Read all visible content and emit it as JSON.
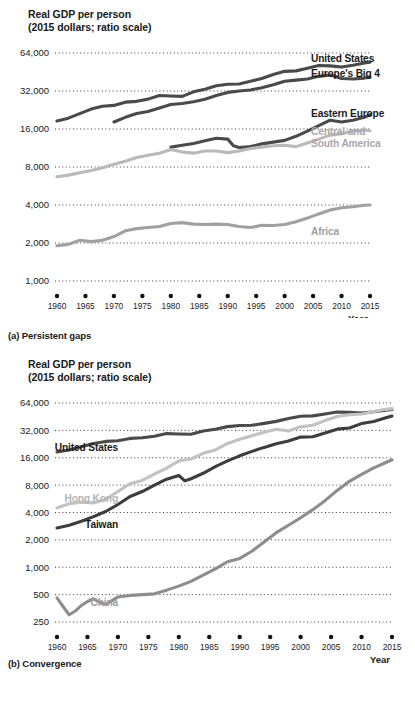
{
  "panels": {
    "a": {
      "axis_title_line1": "Real GDP per person",
      "axis_title_line2": "(2015 dollars; ratio scale)",
      "caption": "(a) Persistent gaps",
      "x_axis_label": "Year"
    },
    "b": {
      "axis_title_line1": "Real GDP per person",
      "axis_title_line2": "(2015 dollars; ratio scale)",
      "caption": "(b) Convergence",
      "x_axis_label": "Year"
    }
  },
  "colors": {
    "dark": "#4a4a4a",
    "darker": "#3d3d3d",
    "mid_gray": "#8d8d8d",
    "light_gray": "#b9b9b9",
    "text": "#1a1a1a",
    "label_gray": "#9d9d9d",
    "grid": "#3b3b3b"
  },
  "chart_data": [
    {
      "type": "line",
      "title": "Real GDP per person",
      "subtitle": "(2015 dollars; ratio scale)",
      "caption": "(a) Persistent gaps",
      "xlabel": "Year",
      "ylabel": "Real GDP per person (2015 dollars; ratio scale)",
      "scale": "log",
      "grid": true,
      "legend": "right-inline",
      "ylim": [
        1000,
        64000
      ],
      "yticks": [
        1000,
        2000,
        4000,
        8000,
        16000,
        32000,
        64000
      ],
      "ytick_labels": [
        "1,000",
        "2,000",
        "4,000",
        "8,000",
        "16,000",
        "32,000",
        "64,000"
      ],
      "xlim": [
        1960,
        2015
      ],
      "xticks": [
        1960,
        1965,
        1970,
        1975,
        1980,
        1985,
        1990,
        1995,
        2000,
        2005,
        2010,
        2015
      ],
      "xtick_labels": [
        "1960",
        "1965",
        "1970",
        "1975",
        "1980",
        "1985",
        "1990",
        "1995",
        "2000",
        "2005",
        "2010",
        "2015"
      ],
      "series": [
        {
          "name": "United States",
          "color": "#4a4a4a",
          "label_color": "#1a1a1a",
          "x": [
            1960,
            1962,
            1964,
            1966,
            1968,
            1970,
            1972,
            1974,
            1976,
            1978,
            1980,
            1982,
            1984,
            1986,
            1988,
            1990,
            1992,
            1994,
            1996,
            1998,
            2000,
            2002,
            2004,
            2006,
            2008,
            2010,
            2012,
            2014,
            2015
          ],
          "values": [
            18500,
            19500,
            21200,
            23000,
            24200,
            24600,
            26100,
            26500,
            27600,
            29500,
            29200,
            29000,
            31500,
            33000,
            35200,
            36200,
            36400,
            38200,
            40200,
            43200,
            45800,
            46200,
            48500,
            51000,
            50600,
            49500,
            51200,
            53400,
            54200
          ]
        },
        {
          "name": "Europe's Big 4",
          "color": "#4a4a4a",
          "label_color": "#1a1a1a",
          "x": [
            1970,
            1972,
            1974,
            1976,
            1978,
            1980,
            1982,
            1984,
            1986,
            1988,
            1990,
            1992,
            1994,
            1996,
            1998,
            2000,
            2002,
            2004,
            2006,
            2008,
            2010,
            2012,
            2014,
            2015
          ],
          "values": [
            18200,
            19800,
            21200,
            22000,
            23500,
            25000,
            25500,
            26300,
            27500,
            29500,
            31200,
            32000,
            32600,
            34000,
            35800,
            38200,
            39000,
            39800,
            41800,
            42800,
            40200,
            39800,
            40500,
            41200
          ]
        },
        {
          "name": "Eastern Europe",
          "color": "#4a4a4a",
          "label_color": "#1a1a1a",
          "x": [
            1980,
            1982,
            1984,
            1986,
            1988,
            1990,
            1991,
            1992,
            1994,
            1996,
            1998,
            2000,
            2002,
            2004,
            2006,
            2008,
            2010,
            2012,
            2014,
            2015
          ],
          "values": [
            11500,
            11900,
            12300,
            12900,
            13500,
            13300,
            11800,
            11400,
            11600,
            12200,
            12600,
            13000,
            14000,
            15400,
            17000,
            18800,
            18200,
            18800,
            19800,
            20800
          ]
        },
        {
          "name": "Central and South America",
          "label_line1": "Central and",
          "label_line2": "South America",
          "color": "#b9b9b9",
          "label_color": "#a8a8a8",
          "x": [
            1960,
            1962,
            1964,
            1966,
            1968,
            1970,
            1972,
            1974,
            1976,
            1978,
            1980,
            1982,
            1984,
            1986,
            1988,
            1990,
            1992,
            1994,
            1996,
            1998,
            2000,
            2002,
            2004,
            2006,
            2008,
            2010,
            2012,
            2014,
            2015
          ],
          "values": [
            6700,
            6900,
            7200,
            7500,
            7900,
            8400,
            8900,
            9500,
            9900,
            10300,
            11000,
            10500,
            10300,
            10700,
            10700,
            10400,
            10700,
            11200,
            11500,
            11800,
            11900,
            11600,
            12400,
            13300,
            14300,
            14700,
            15400,
            15700,
            15500
          ]
        },
        {
          "name": "Africa",
          "color": "#a0a0a0",
          "label_color": "#a0a0a0",
          "x": [
            1960,
            1962,
            1964,
            1966,
            1968,
            1970,
            1972,
            1974,
            1976,
            1978,
            1980,
            1982,
            1984,
            1986,
            1988,
            1990,
            1992,
            1994,
            1996,
            1998,
            2000,
            2002,
            2004,
            2006,
            2008,
            2010,
            2012,
            2014,
            2015
          ],
          "values": [
            1900,
            1950,
            2100,
            2050,
            2100,
            2250,
            2500,
            2600,
            2650,
            2700,
            2850,
            2900,
            2820,
            2800,
            2820,
            2800,
            2700,
            2650,
            2760,
            2750,
            2800,
            2950,
            3150,
            3400,
            3650,
            3800,
            3880,
            3980,
            4000
          ]
        }
      ]
    },
    {
      "type": "line",
      "title": "Real GDP per person",
      "subtitle": "(2015 dollars; ratio scale)",
      "caption": "(b) Convergence",
      "xlabel": "Year",
      "ylabel": "Real GDP per person (2015 dollars; ratio scale)",
      "scale": "log",
      "grid": true,
      "legend": "inline",
      "ylim": [
        250,
        64000
      ],
      "yticks": [
        250,
        500,
        1000,
        2000,
        4000,
        8000,
        16000,
        32000,
        64000
      ],
      "ytick_labels": [
        "250",
        "500",
        "1,000",
        "2,000",
        "4,000",
        "8,000",
        "16,000",
        "32,000",
        "64,000"
      ],
      "xlim": [
        1960,
        2015
      ],
      "xticks": [
        1960,
        1965,
        1970,
        1975,
        1980,
        1985,
        1990,
        1995,
        2000,
        2005,
        2010,
        2015
      ],
      "xtick_labels": [
        "1960",
        "1965",
        "1970",
        "1975",
        "1980",
        "1985",
        "1990",
        "1995",
        "2000",
        "2005",
        "2010",
        "2015"
      ],
      "series": [
        {
          "name": "United States",
          "color": "#4a4a4a",
          "label_color": "#1a1a1a",
          "x": [
            1960,
            1962,
            1964,
            1966,
            1968,
            1970,
            1972,
            1974,
            1976,
            1978,
            1980,
            1982,
            1984,
            1986,
            1988,
            1990,
            1992,
            1994,
            1996,
            1998,
            2000,
            2002,
            2004,
            2006,
            2008,
            2010,
            2012,
            2014,
            2015
          ],
          "values": [
            18500,
            19500,
            21200,
            23000,
            24200,
            24600,
            26100,
            26500,
            27600,
            29500,
            29200,
            29000,
            31500,
            33000,
            35200,
            36200,
            36400,
            38200,
            40200,
            43200,
            45800,
            46200,
            48500,
            51000,
            50600,
            49500,
            51200,
            53400,
            54200
          ]
        },
        {
          "name": "Hong Kong",
          "color": "#c2c2c2",
          "label_color": "#b4b4b4",
          "x": [
            1960,
            1962,
            1964,
            1966,
            1968,
            1970,
            1972,
            1974,
            1976,
            1978,
            1980,
            1982,
            1984,
            1986,
            1988,
            1990,
            1992,
            1994,
            1996,
            1998,
            2000,
            2002,
            2004,
            2006,
            2008,
            2010,
            2012,
            2014,
            2015
          ],
          "values": [
            4500,
            5000,
            5200,
            5100,
            5600,
            6800,
            8300,
            9000,
            10600,
            12300,
            14800,
            15500,
            17900,
            19500,
            23000,
            25500,
            28000,
            30500,
            33000,
            31500,
            35000,
            36500,
            41000,
            45500,
            47500,
            48500,
            51500,
            54500,
            55500
          ]
        },
        {
          "name": "Taiwan",
          "color": "#3d3d3d",
          "label_color": "#1a1a1a",
          "x": [
            1960,
            1962,
            1964,
            1966,
            1968,
            1970,
            1972,
            1974,
            1976,
            1978,
            1980,
            1981,
            1982,
            1984,
            1986,
            1988,
            1990,
            1992,
            1994,
            1996,
            1998,
            2000,
            2002,
            2004,
            2006,
            2008,
            2010,
            2012,
            2014,
            2015
          ],
          "values": [
            2700,
            2900,
            3200,
            3600,
            4100,
            4900,
            6000,
            6800,
            8000,
            9300,
            10200,
            8900,
            9400,
            10800,
            12800,
            14800,
            16800,
            18800,
            20800,
            22800,
            24500,
            27000,
            27200,
            30000,
            33000,
            34000,
            38000,
            40000,
            44000,
            46000
          ]
        },
        {
          "name": "China",
          "color": "#8d8d8d",
          "label_color": "#9d9d9d",
          "x": [
            1960,
            1961,
            1962,
            1963,
            1964,
            1965,
            1966,
            1967,
            1968,
            1969,
            1970,
            1972,
            1974,
            1976,
            1978,
            1980,
            1982,
            1984,
            1986,
            1988,
            1990,
            1992,
            1994,
            1996,
            1998,
            2000,
            2002,
            2004,
            2006,
            2008,
            2010,
            2012,
            2014,
            2015
          ],
          "values": [
            460,
            370,
            300,
            330,
            380,
            420,
            450,
            410,
            390,
            430,
            470,
            490,
            500,
            510,
            560,
            620,
            700,
            820,
            960,
            1150,
            1250,
            1500,
            1900,
            2400,
            2900,
            3500,
            4300,
            5400,
            7000,
            8800,
            10500,
            12400,
            14200,
            15200
          ]
        }
      ]
    }
  ]
}
